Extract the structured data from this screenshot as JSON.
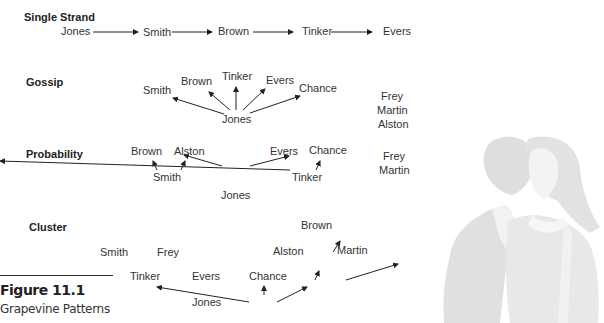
{
  "figure": {
    "number": "Figure 11.1",
    "caption": "Grapevine Patterns"
  },
  "sections": {
    "single_strand": {
      "title": "Single Strand",
      "nodes": [
        "Jones",
        "Smith",
        "Brown",
        "Tinker",
        "Evers"
      ]
    },
    "gossip": {
      "title": "Gossip",
      "center": "Jones",
      "targets": [
        "Smith",
        "Brown",
        "Tinker",
        "Evers",
        "Chance"
      ],
      "uninformed": [
        "Frey",
        "Martin",
        "Alston"
      ]
    },
    "probability": {
      "title": "Probability",
      "source": "Jones",
      "smith": "Smith",
      "smith_targets": [
        "Brown",
        "Alston"
      ],
      "tinker": "Tinker",
      "tinker_targets": [
        "Evers",
        "Chance"
      ],
      "uninformed": [
        "Frey",
        "Martin"
      ]
    },
    "cluster": {
      "title": "Cluster",
      "isolated": [
        "Smith",
        "Frey"
      ],
      "source": "Jones",
      "level1": [
        "Tinker",
        "Evers",
        "Chance"
      ],
      "chance_targets": [
        "Alston",
        "Martin"
      ],
      "alston_target": "Brown"
    }
  },
  "illustration": {
    "icon": "couple-whispering-illustration"
  }
}
